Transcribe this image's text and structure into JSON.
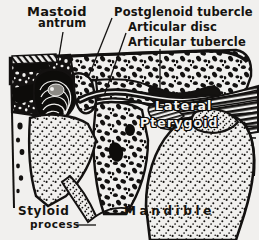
{
  "figure": {
    "paper_color": "#f1f0ee",
    "ink_color": "#15130f",
    "reverse_text_color": "#f4f3f1"
  },
  "labels": {
    "mastoid": "Mastoid",
    "antrum": "antrum",
    "postglenoid_tubercle": "Postglenoid tubercle",
    "articular_disc": "Articular disc",
    "articular_tubercle": "Articular tubercle",
    "lateral": "Lateral",
    "pterygoid": "Pterygoid",
    "styloid": "Styloid",
    "process": "process",
    "mandible": "Mandible"
  },
  "structures": [
    {
      "name": "mastoid-antrum",
      "label": "Mastoid antrum",
      "texture": "trabecular-bone"
    },
    {
      "name": "postglenoid-tubercle",
      "label": "Postglenoid tubercle",
      "texture": "cortical-bone"
    },
    {
      "name": "articular-disc",
      "label": "Articular disc",
      "texture": "solid-dark-band"
    },
    {
      "name": "articular-tubercle",
      "label": "Articular tubercle",
      "texture": "cortical-bone"
    },
    {
      "name": "lateral-pterygoid-muscle",
      "label": "Lateral Pterygoid",
      "texture": "striated-muscle"
    },
    {
      "name": "styloid-process",
      "label": "Styloid process",
      "texture": "stipple"
    },
    {
      "name": "mandible",
      "label": "Mandible",
      "texture": "stipple"
    },
    {
      "name": "external-auditory-meatus",
      "label": "",
      "texture": "concentric-lines"
    }
  ]
}
